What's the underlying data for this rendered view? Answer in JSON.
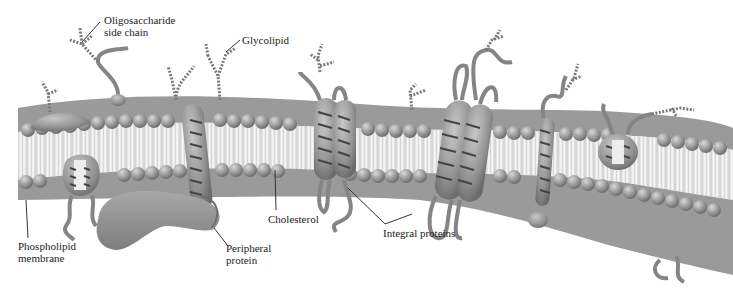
{
  "diagram": {
    "colors": {
      "background": "#ffffff",
      "head": "#9a9a9a",
      "head_light": "#c4c4c4",
      "tail": "#e8e8e8",
      "protein": "#8c8c8c",
      "protein_light": "#b5b5b5",
      "chain": "#7a7a7a",
      "leader": "#333333",
      "text": "#222222"
    },
    "labels": {
      "oligosaccharide": [
        "Oligosaccharide",
        "side chain"
      ],
      "glycolipid": "Glycolipid",
      "phospholipid": [
        "Phospholipid",
        "membrane"
      ],
      "peripheral": [
        "Peripheral",
        "protein"
      ],
      "cholesterol": "Cholesterol",
      "integral": "Integral proteins"
    }
  }
}
